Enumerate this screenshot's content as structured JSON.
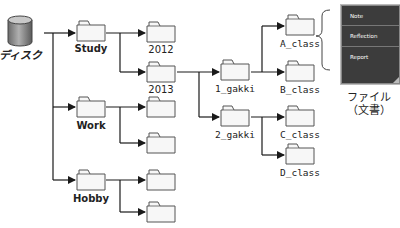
{
  "disk": {
    "label": "ディスク",
    "icon": "disk-cylinder-icon"
  },
  "level1": [
    {
      "label": "Study"
    },
    {
      "label": "Work"
    },
    {
      "label": "Hobby"
    }
  ],
  "study_children": [
    {
      "label": "2012"
    },
    {
      "label": "2013"
    }
  ],
  "year2013_children": [
    {
      "label": "1_gakki"
    },
    {
      "label": "2_gakki"
    }
  ],
  "gakki1_children": [
    {
      "label": "A_class"
    },
    {
      "label": "B_class"
    }
  ],
  "gakki2_children": [
    {
      "label": "C_class"
    },
    {
      "label": "D_class"
    }
  ],
  "file_panel": {
    "items": [
      "Note",
      "Reflection",
      "Report"
    ],
    "caption_line1": "ファイル",
    "caption_line2": "（文書）"
  },
  "colors": {
    "line": "#1a1a1a",
    "folder_fill": "#f7f7f7",
    "folder_stroke": "#555555",
    "doc_fill": "#3c3c3c"
  }
}
